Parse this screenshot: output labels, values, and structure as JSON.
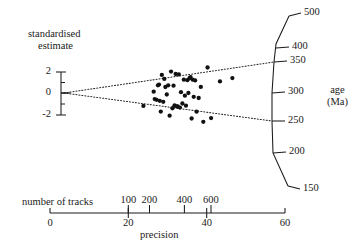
{
  "figure": {
    "type": "radial-plot",
    "y_axis_title_line1": "standardised",
    "y_axis_title_line2": "estimate",
    "age_axis_title_line1": "age",
    "age_axis_title_line2": "(Ma)",
    "tracks_axis_caption": "number of tracks",
    "precision_axis_caption": "precision",
    "ink_color": "#1a1a1a",
    "point_color": "#111111",
    "background_color": "#ffffff"
  },
  "chart_data": {
    "type": "scatter",
    "title": "",
    "xlabel": "precision",
    "ylabel": "standardised estimate",
    "secondary_xlabel": "number of tracks",
    "secondary_ylabel": "age (Ma)",
    "grid": false,
    "legend": "none",
    "xlim": [
      0,
      60
    ],
    "ylim": [
      -3.2,
      3.2
    ],
    "x_ticks": [
      0,
      20,
      40,
      60
    ],
    "x_tick_labels": [
      "0",
      "20",
      "40",
      "60"
    ],
    "tracks_ticks_values": [
      100,
      200,
      400,
      600
    ],
    "tracks_tick_labels": [
      "100",
      "200",
      "400",
      "600"
    ],
    "tracks_tick_x_precision": [
      20,
      25.4,
      34.3,
      41.1
    ],
    "y_ticks": [
      2,
      0,
      -2
    ],
    "y_tick_labels": [
      "2",
      "0",
      "-2"
    ],
    "age_ticks": [
      500,
      400,
      350,
      300,
      250,
      200,
      150
    ],
    "age_tick_labels": [
      "500",
      "400",
      "350",
      "300",
      "250",
      "200",
      "150"
    ],
    "central_age": 297,
    "band_upper_age": 350,
    "band_lower_age": 250,
    "band_style": "dotted",
    "points_xy": [
      [
        22.4,
        -2.2
      ],
      [
        25.3,
        0.2
      ],
      [
        25.6,
        -0.9
      ],
      [
        26.1,
        -1.0
      ],
      [
        26.5,
        1.1
      ],
      [
        26.8,
        1.2
      ],
      [
        27.0,
        -1.1
      ],
      [
        27.3,
        -2.6
      ],
      [
        27.6,
        2.5
      ],
      [
        28.0,
        -1.2
      ],
      [
        28.3,
        1.9
      ],
      [
        28.6,
        0.8
      ],
      [
        29.0,
        -0.2
      ],
      [
        29.4,
        1.0
      ],
      [
        29.8,
        -2.9
      ],
      [
        30.2,
        2.7
      ],
      [
        30.6,
        -1.9
      ],
      [
        30.9,
        0.9
      ],
      [
        31.2,
        -1.5
      ],
      [
        31.5,
        2.3
      ],
      [
        31.8,
        -1.6
      ],
      [
        32.1,
        -1.6
      ],
      [
        32.4,
        2.2
      ],
      [
        32.7,
        -1.7
      ],
      [
        33.0,
        0.1
      ],
      [
        33.4,
        -1.2
      ],
      [
        33.8,
        1.5
      ],
      [
        34.1,
        -0.3
      ],
      [
        34.4,
        -1.4
      ],
      [
        34.8,
        1.4
      ],
      [
        35.1,
        0.0
      ],
      [
        35.4,
        1.6
      ],
      [
        35.7,
        1.7
      ],
      [
        36.0,
        -2.7
      ],
      [
        36.3,
        1.4
      ],
      [
        36.6,
        -0.4
      ],
      [
        37.0,
        1.3
      ],
      [
        37.4,
        -1.9
      ],
      [
        38.0,
        -0.5
      ],
      [
        38.6,
        0.6
      ],
      [
        39.3,
        -2.8
      ],
      [
        40.5,
        2.4
      ],
      [
        41.5,
        -2.3
      ],
      [
        44.0,
        1.0
      ],
      [
        47.5,
        1.2
      ]
    ]
  }
}
